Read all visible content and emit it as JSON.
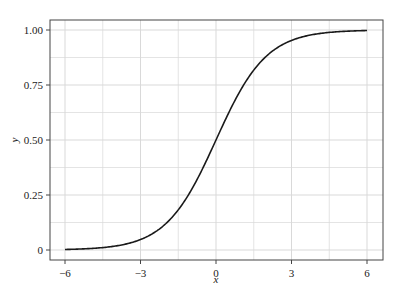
{
  "chart_data": {
    "type": "line",
    "title": "",
    "xlabel": "x",
    "ylabel": "y",
    "xlim": [
      -6.6,
      6.6
    ],
    "ylim": [
      -0.045,
      1.045
    ],
    "x_ticks": [
      -6,
      -3,
      0,
      3,
      6
    ],
    "x_tick_labels": [
      "−6",
      "−3",
      "0",
      "3",
      "6"
    ],
    "y_ticks": [
      0,
      0.25,
      0.5,
      0.75,
      1.0
    ],
    "y_tick_labels": [
      "0",
      "0.25",
      "0.50",
      "0.75",
      "1.00"
    ],
    "grid": true,
    "minor_grid": true,
    "legend": null,
    "series": [
      {
        "name": "sigmoid",
        "color": "#1a1a1a",
        "function": "1/(1+exp(-x))",
        "x": [
          -6,
          -5,
          -4,
          -3,
          -2,
          -1,
          0,
          1,
          2,
          3,
          4,
          5,
          6
        ],
        "y": [
          0.0025,
          0.0067,
          0.018,
          0.047,
          0.119,
          0.269,
          0.5,
          0.731,
          0.881,
          0.953,
          0.982,
          0.9933,
          0.9975
        ]
      }
    ]
  },
  "colors": {
    "grid": "#d9d9d9",
    "axis": "#444444",
    "line": "#1a1a1a"
  }
}
